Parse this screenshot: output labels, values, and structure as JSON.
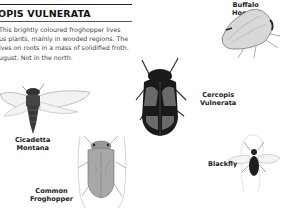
{
  "page": {
    "title": "OPIS VULNERATA",
    "description_lines": [
      "This brightly coloured froghopper lives",
      "us plants, mainly in wooded regions. The",
      "ives on roots in a mass of solidified froth.",
      "ugust. Not in the north."
    ]
  },
  "insects": [
    {
      "name": "buffalo-hopper",
      "label_lines": [
        "Buffalo",
        "Hopper"
      ]
    },
    {
      "name": "cercopis-vulnerata",
      "label_lines": [
        "Cercopis",
        "Vulnerata"
      ]
    },
    {
      "name": "cicadetta-montana",
      "label_lines": [
        "Cicadetta",
        "Montana"
      ]
    },
    {
      "name": "common-froghopper",
      "label_lines": [
        "Common",
        "Froghopper"
      ]
    },
    {
      "name": "blackfly",
      "label_lines": [
        "Blackfly"
      ]
    }
  ],
  "colors": {
    "background": "#ffffff",
    "text": "#444444",
    "label": "#222222",
    "dark_insect": "#1a1a1a",
    "red_markings": "#6a6a6a"
  }
}
